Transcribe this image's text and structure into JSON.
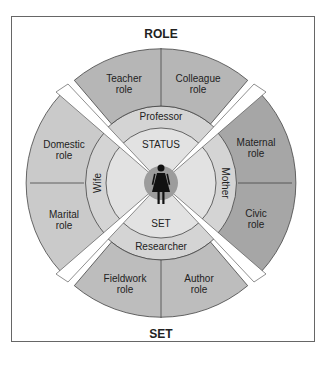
{
  "diagram": {
    "top_label": "ROLE",
    "bottom_label": "SET",
    "center": {
      "status_label": "STATUS",
      "set_label": "SET",
      "figure": "woman-figure-icon"
    },
    "statuses": {
      "top": "Professor",
      "left": "Wife",
      "right": "Mother",
      "bottom": "Researcher"
    },
    "roles": {
      "top_left": [
        "Teacher",
        "role"
      ],
      "top_right": [
        "Colleague",
        "role"
      ],
      "left_top": [
        "Domestic",
        "role"
      ],
      "left_bottom": [
        "Marital",
        "role"
      ],
      "right_top": [
        "Maternal",
        "role"
      ],
      "right_bottom": [
        "Civic",
        "role"
      ],
      "bottom_left": [
        "Fieldwork",
        "role"
      ],
      "bottom_right": [
        "Author",
        "role"
      ]
    },
    "colors": {
      "top": "#b4b4b4",
      "left": "#c8c8c8",
      "right": "#a4a4a4",
      "bottom": "#bcbcbc",
      "ring": "#d2d2d2",
      "inner": "#dedede",
      "center": "#9c9c9c"
    }
  }
}
